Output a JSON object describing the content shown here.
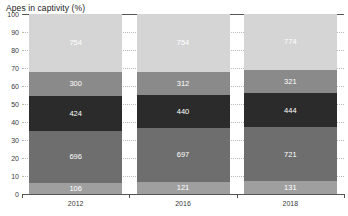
{
  "chart_data": {
    "type": "bar",
    "title": "Apes in captivity (%)",
    "xlabel": "",
    "ylabel": "",
    "ylim": [
      0,
      100
    ],
    "yticks": [
      0,
      10,
      20,
      30,
      40,
      50,
      60,
      70,
      80,
      90,
      100
    ],
    "grid": true,
    "legend": false,
    "stacked": true,
    "normalized_percent": true,
    "categories": [
      "2012",
      "2016",
      "2018"
    ],
    "series": [
      {
        "name": "segment-1",
        "color": "#9f9f9f",
        "values": [
          106,
          121,
          131
        ],
        "percent": [
          6.0,
          6.6,
          7.0
        ]
      },
      {
        "name": "segment-2",
        "color": "#6e6e6e",
        "values": [
          696,
          697,
          721
        ],
        "percent": [
          29.0,
          29.9,
          30.0
        ]
      },
      {
        "name": "segment-3",
        "color": "#2b2b2b",
        "values": [
          424,
          440,
          444
        ],
        "percent": [
          19.5,
          18.5,
          19.0
        ]
      },
      {
        "name": "segment-4",
        "color": "#8a8a8a",
        "values": [
          300,
          312,
          321
        ],
        "percent": [
          13.5,
          13.0,
          13.0
        ]
      },
      {
        "name": "segment-5",
        "color": "#d5d5d5",
        "values": [
          754,
          754,
          774
        ],
        "percent": [
          32.0,
          32.0,
          31.0
        ]
      }
    ]
  }
}
